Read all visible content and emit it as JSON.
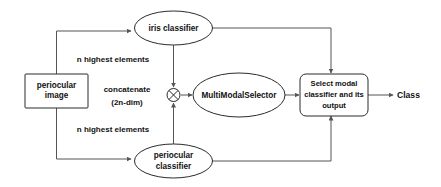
{
  "diagram": {
    "nodes": {
      "input_box": {
        "label": "periocular image",
        "line1": "periocular",
        "line2": "image",
        "shape": "rectangle"
      },
      "iris_classifier": {
        "label": "iris classifier",
        "shape": "ellipse"
      },
      "periocular_classifier": {
        "label": "periocular classifier",
        "line1": "periocular",
        "line2": "classifier",
        "shape": "ellipse"
      },
      "concatenate_node": {
        "label": "",
        "icon": "circle-x-operator-icon",
        "shape": "circle-with-x"
      },
      "multimodal_selector": {
        "label": "MultiModalSelector",
        "shape": "ellipse"
      },
      "select_modal": {
        "label": "Select modal classifier and its output",
        "line1": "Select modal",
        "line2": "classifier and its",
        "line3": "output",
        "shape": "rounded-rectangle"
      }
    },
    "edge_labels": {
      "top_branch": "n highest elements",
      "bottom_branch": "n highest elements",
      "concatenate_line1": "concatenate",
      "concatenate_line2": "(2n-dim)"
    },
    "output": {
      "label": "Class"
    },
    "colors": {
      "background": "#ffffff",
      "shape_stroke": "#2b2b2b",
      "connector_stroke": "#555555",
      "text": "#111111"
    }
  }
}
